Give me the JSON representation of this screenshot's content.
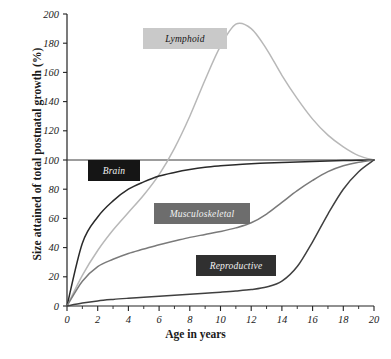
{
  "chart_data": {
    "type": "line",
    "title": "",
    "xlabel": "Age in years",
    "ylabel": "Size attained of total postnatal growth (%)",
    "xlim": [
      0,
      20
    ],
    "ylim": [
      0,
      200
    ],
    "xticks": [
      0,
      2,
      4,
      6,
      8,
      10,
      12,
      14,
      16,
      18,
      20
    ],
    "xtick_labels": [
      "0",
      "2",
      "4",
      "6",
      "8",
      "10",
      "12",
      "14",
      "16",
      "18",
      "20"
    ],
    "xminor_ticks": [
      1,
      3,
      5,
      7,
      9,
      11,
      13,
      15,
      17,
      19
    ],
    "yticks": [
      0,
      20,
      40,
      60,
      80,
      100,
      120,
      140,
      160,
      180,
      200
    ],
    "ytick_labels": [
      "0",
      "20",
      "40",
      "60",
      "80",
      "100",
      "120",
      "140",
      "160",
      "180",
      "200"
    ],
    "grid": false,
    "legend_position": "inline-boxes",
    "reference_line_y": 100,
    "x": [
      0,
      1,
      2,
      3,
      4,
      5,
      6,
      7,
      8,
      9,
      10,
      11,
      12,
      13,
      14,
      15,
      16,
      17,
      18,
      19,
      20
    ],
    "series": [
      {
        "name": "Lymphoid",
        "color": "#b8b8b8",
        "peak_x": 11.2,
        "peak_y": 193,
        "values": [
          0,
          21,
          38,
          52,
          64,
          76,
          90,
          108,
          130,
          155,
          178,
          193,
          190,
          176,
          158,
          142,
          128,
          117,
          109,
          103,
          100
        ]
      },
      {
        "name": "Brain",
        "color": "#2a2a2a",
        "values": [
          0,
          43,
          61,
          72,
          80,
          85,
          89,
          91.5,
          93.5,
          95,
          96,
          96.8,
          97.4,
          97.9,
          98.3,
          98.7,
          99,
          99.3,
          99.6,
          99.8,
          100
        ]
      },
      {
        "name": "Musculoskeletal",
        "color": "#7a7a7a",
        "values": [
          0,
          17,
          27,
          32,
          36,
          39,
          42,
          44.5,
          47,
          49,
          51,
          53.5,
          57,
          63,
          71,
          79,
          86,
          92,
          96,
          98.5,
          100
        ]
      },
      {
        "name": "Reproductive",
        "color": "#404040",
        "values": [
          0,
          2,
          3.5,
          4.5,
          5.3,
          6,
          6.7,
          7.4,
          8.1,
          8.8,
          9.5,
          10.3,
          11.3,
          13,
          17,
          27,
          44,
          63,
          80,
          92,
          100
        ]
      }
    ]
  },
  "axis": {
    "ylabel_text": "Size attained of total postnatal growth (%)",
    "xlabel_text": "Age in years"
  },
  "labels": {
    "lymphoid": "Lymphoid",
    "brain": "Brain",
    "musculoskeletal": "Musculoskeletal",
    "reproductive": "Reproductive"
  }
}
